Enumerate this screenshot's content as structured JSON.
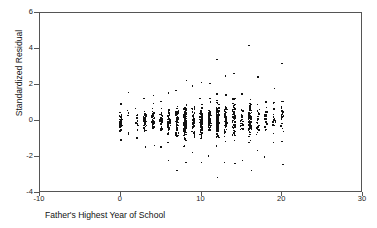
{
  "chart_data": {
    "type": "scatter",
    "title": "",
    "xlabel": "Father's Highest Year of School",
    "ylabel": "Standardized Residual",
    "xlim": [
      -10,
      30
    ],
    "ylim": [
      -4,
      6
    ],
    "xticks": [
      -10,
      0,
      10,
      20,
      30
    ],
    "yticks": [
      -4,
      -2,
      0,
      2,
      4,
      6
    ],
    "xtick_labels": [
      "-10",
      "0",
      "10",
      "20",
      "30"
    ],
    "ytick_labels": [
      "-4",
      "-2",
      "0",
      "2",
      "4",
      "6"
    ],
    "grid": false,
    "legend": null,
    "marker_color": "#111111",
    "frame_color": "#555555",
    "background": "#ffffff",
    "note": "Residual plot; observations stack in vertical strips at integer years of schooling.",
    "columns": [
      {
        "x": 0,
        "n": 46,
        "y_min": -1.05,
        "y_max": 0.95,
        "y_center": -0.05,
        "y_spread": 0.42
      },
      {
        "x": 1,
        "n": 6,
        "y_min": -0.75,
        "y_max": 1.6,
        "y_center": 0.1,
        "y_spread": 0.55
      },
      {
        "x": 2,
        "n": 14,
        "y_min": -0.95,
        "y_max": 0.7,
        "y_center": 0.0,
        "y_spread": 0.4
      },
      {
        "x": 3,
        "n": 40,
        "y_min": -1.45,
        "y_max": 1.25,
        "y_center": 0.05,
        "y_spread": 0.52
      },
      {
        "x": 4,
        "n": 38,
        "y_min": -1.35,
        "y_max": 1.4,
        "y_center": 0.05,
        "y_spread": 0.55
      },
      {
        "x": 5,
        "n": 34,
        "y_min": -1.45,
        "y_max": 1.1,
        "y_center": 0.0,
        "y_spread": 0.54
      },
      {
        "x": 6,
        "n": 48,
        "y_min": -2.2,
        "y_max": 1.55,
        "y_center": -0.05,
        "y_spread": 0.68
      },
      {
        "x": 7,
        "n": 54,
        "y_min": -2.75,
        "y_max": 1.7,
        "y_center": -0.05,
        "y_spread": 0.76
      },
      {
        "x": 8,
        "n": 120,
        "y_min": -2.3,
        "y_max": 2.25,
        "y_center": -0.05,
        "y_spread": 0.8
      },
      {
        "x": 9,
        "n": 58,
        "y_min": -1.75,
        "y_max": 1.95,
        "y_center": 0.0,
        "y_spread": 0.72
      },
      {
        "x": 10,
        "n": 96,
        "y_min": -2.3,
        "y_max": 2.15,
        "y_center": -0.05,
        "y_spread": 0.78
      },
      {
        "x": 11,
        "n": 62,
        "y_min": -1.95,
        "y_max": 2.1,
        "y_center": 0.05,
        "y_spread": 0.74
      },
      {
        "x": 12,
        "n": 130,
        "y_min": -3.15,
        "y_max": 3.4,
        "y_center": 0.0,
        "y_spread": 0.85
      },
      {
        "x": 13,
        "n": 52,
        "y_min": -2.3,
        "y_max": 2.5,
        "y_center": 0.05,
        "y_spread": 0.82
      },
      {
        "x": 14,
        "n": 64,
        "y_min": -2.35,
        "y_max": 2.65,
        "y_center": 0.1,
        "y_spread": 0.86
      },
      {
        "x": 15,
        "n": 34,
        "y_min": -2.2,
        "y_max": 1.5,
        "y_center": 0.05,
        "y_spread": 0.78
      },
      {
        "x": 16,
        "n": 78,
        "y_min": -2.75,
        "y_max": 4.2,
        "y_center": 0.15,
        "y_spread": 0.95
      },
      {
        "x": 17,
        "n": 26,
        "y_min": -1.65,
        "y_max": 2.45,
        "y_center": 0.25,
        "y_spread": 0.88
      },
      {
        "x": 18,
        "n": 22,
        "y_min": -2.0,
        "y_max": 1.05,
        "y_center": 0.15,
        "y_spread": 0.72
      },
      {
        "x": 19,
        "n": 18,
        "y_min": -1.2,
        "y_max": 1.8,
        "y_center": 0.1,
        "y_spread": 0.7
      },
      {
        "x": 20,
        "n": 24,
        "y_min": -2.4,
        "y_max": 3.2,
        "y_center": 0.15,
        "y_spread": 0.95
      }
    ]
  }
}
